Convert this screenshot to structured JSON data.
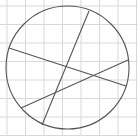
{
  "diagram": {
    "type": "geometry",
    "canvas": {
      "width": 138,
      "height": 136
    },
    "grid": {
      "color": "#d9d9d9",
      "vertical_lines_x": [
        7,
        25.5,
        44,
        62.5,
        81,
        99.5,
        118,
        136.5
      ],
      "horizontal_lines_y": [
        6,
        24.5,
        43,
        61.5,
        80,
        98.5,
        117,
        135.5
      ]
    },
    "circle": {
      "cx": 67.5,
      "cy": 67.5,
      "r": 61.5,
      "stroke": "#555555",
      "stroke_width": 1.1
    },
    "chords": [
      {
        "name": "chord-a",
        "x1": 9,
        "y1": 48,
        "x2": 126,
        "y2": 86
      },
      {
        "name": "chord-b",
        "x1": 89,
        "y1": 11,
        "x2": 42,
        "y2": 125
      },
      {
        "name": "chord-c",
        "x1": 21,
        "y1": 108,
        "x2": 128,
        "y2": 60
      }
    ],
    "line_color": "#555555"
  }
}
